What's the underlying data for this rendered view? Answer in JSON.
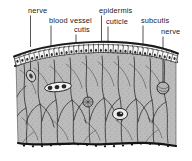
{
  "figure": {
    "type": "labeled-anatomical-cross-section",
    "style": "black-and-white engraved textbook illustration",
    "width": 192,
    "height": 161,
    "background_color": "#ffffff",
    "ink_color": "#1c1c1c",
    "tissue_fill_color": "#b9b9b9"
  },
  "labels": [
    {
      "id": "nerve-left",
      "text": "nerve",
      "x": 28,
      "y": 13,
      "anchor": "start",
      "leader": {
        "x1": 30.5,
        "y1": 15.5,
        "x2": 30.5,
        "y2": 47.0
      }
    },
    {
      "id": "blood-vessel",
      "text": "blood vessel",
      "x": 49,
      "y": 23,
      "anchor": "start",
      "leader": {
        "x1": 51.0,
        "y1": 25.5,
        "x2": 51.0,
        "y2": 50.0
      }
    },
    {
      "id": "cutis",
      "text": "cutis",
      "x": 74,
      "y": 32,
      "anchor": "start",
      "leader": {
        "x1": 76.0,
        "y1": 34.5,
        "x2": 76.0,
        "y2": 53.5
      }
    },
    {
      "id": "epidermis",
      "text": "epidermis",
      "x": 99,
      "y": 13,
      "anchor": "start",
      "leader": {
        "x1": 101.5,
        "y1": 15.5,
        "x2": 101.5,
        "y2": 46.5
      }
    },
    {
      "id": "cuticle",
      "text": "cuticle",
      "x": 106,
      "y": 24,
      "anchor": "start",
      "leader": {
        "x1": 108.0,
        "y1": 26.5,
        "x2": 108.0,
        "y2": 47.0
      }
    },
    {
      "id": "subcutis",
      "text": "subcutis",
      "x": 141,
      "y": 23,
      "anchor": "start",
      "leader": {
        "x1": 143.0,
        "y1": 25.5,
        "x2": 143.0,
        "y2": 60.0
      }
    },
    {
      "id": "nerve-right",
      "text": "nerve",
      "x": 161,
      "y": 34,
      "anchor": "start",
      "leader": {
        "x1": 163.0,
        "y1": 36.5,
        "x2": 163.0,
        "y2": 55.0
      }
    }
  ],
  "structures": {
    "cuticle": {
      "name": "cuticle",
      "description": "thin dark outer band along top arc"
    },
    "epidermis": {
      "name": "epidermis",
      "description": "row of columnar cells with nuclei",
      "cell_count": 33
    },
    "basement_line": {
      "name": "basement membrane",
      "description": "dark wavy line beneath epidermis"
    },
    "cutis": {
      "name": "cutis",
      "description": "fibrous dermal layer with connective tissue strands"
    },
    "subcutis": {
      "name": "subcutis",
      "description": "dark beaded boundary along bottom"
    },
    "blood_vessel": {
      "name": "blood vessel",
      "description": "elongated capillary with internal cells",
      "cx": 58,
      "cy": 87
    },
    "sensory_corpuscle": {
      "name": "sensory corpuscle",
      "description": "oval body with dark nucleus",
      "cx": 120,
      "cy": 114
    },
    "gland_upper": {
      "name": "gland body",
      "cx": 88,
      "cy": 102
    },
    "nerve_ending_left": {
      "name": "nerve ending",
      "cx": 31,
      "cy": 76
    },
    "nerve_ending_right": {
      "name": "nerve ending",
      "cx": 163,
      "cy": 88
    }
  }
}
